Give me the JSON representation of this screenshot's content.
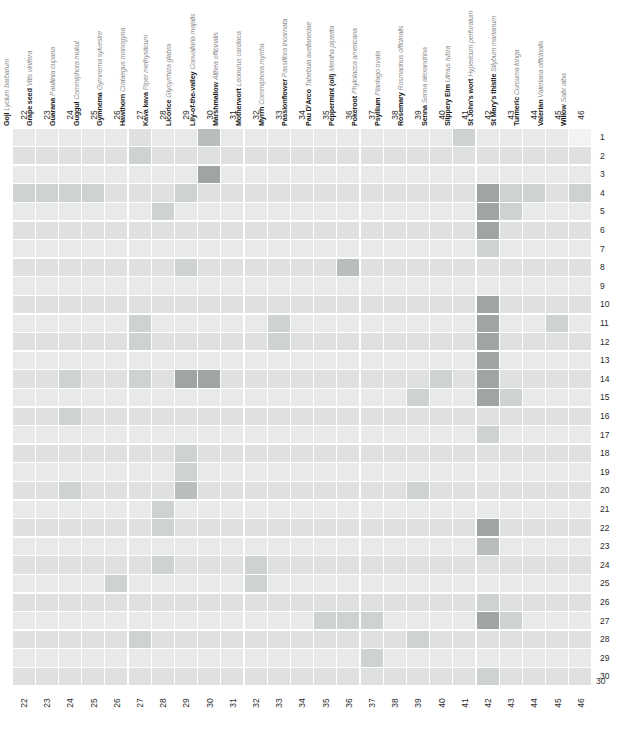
{
  "figure": {
    "type": "heatmap-matrix"
  },
  "columns": [
    {
      "index": "22",
      "common": "Goji",
      "latin": "Lycium barbarum"
    },
    {
      "index": "23",
      "common": "Grape seed",
      "latin": "Vitis vinifera"
    },
    {
      "index": "24",
      "common": "Guarana",
      "latin": "Paullinia cupana"
    },
    {
      "index": "25",
      "common": "Guggul",
      "latin": "Commiphora mukul"
    },
    {
      "index": "26",
      "common": "Gymnema",
      "latin": "Gymnema sylvestre"
    },
    {
      "index": "27",
      "common": "Hawthorn",
      "latin": "Crataegus monogyna"
    },
    {
      "index": "28",
      "common": "Kava kava",
      "latin": "Piper methysticum"
    },
    {
      "index": "29",
      "common": "Licorice",
      "latin": "Glycyrrhiza glabra"
    },
    {
      "index": "30",
      "common": "Lily-of-the-valley",
      "latin": "Convallaria majalis"
    },
    {
      "index": "31",
      "common": "Marshmallow",
      "latin": "Althea officinalis"
    },
    {
      "index": "32",
      "common": "Motherwort",
      "latin": "Leonurus cardiaca"
    },
    {
      "index": "33",
      "common": "Myrrh",
      "latin": "Commiphora myrrha"
    },
    {
      "index": "34",
      "common": "Passionflower",
      "latin": "Passiflora incarnata"
    },
    {
      "index": "35",
      "common": "Pau D'Arco",
      "latin": "Tabebuia avellanedae"
    },
    {
      "index": "36",
      "common": "Peppermint (oil)",
      "latin": "Mentha piperita"
    },
    {
      "index": "37",
      "common": "Pokeroot",
      "latin": "Phytolacca americana"
    },
    {
      "index": "38",
      "common": "Psyllium",
      "latin": "Plantago ovata"
    },
    {
      "index": "39",
      "common": "Rosemary",
      "latin": "Rosmarinus officinalis"
    },
    {
      "index": "40",
      "common": "Senna",
      "latin": "Senna alexandrina"
    },
    {
      "index": "41",
      "common": "Slippery Elm",
      "latin": "Ulmus rubra"
    },
    {
      "index": "42",
      "common": "St John's wort",
      "latin": "Hypericum perforatum"
    },
    {
      "index": "43",
      "common": "St Mary's thistle",
      "latin": "Silybum marianum"
    },
    {
      "index": "44",
      "common": "Turmeric",
      "latin": "Curcuma longa"
    },
    {
      "index": "45",
      "common": "Valerian",
      "latin": "Valeriana officinalis"
    },
    {
      "index": "46",
      "common": "Willow",
      "latin": "Salix alba"
    }
  ],
  "row_numbers": [
    "1",
    "2",
    "3",
    "4",
    "5",
    "6",
    "7",
    "8",
    "9",
    "10",
    "11",
    "12",
    "13",
    "14",
    "15",
    "16",
    "17",
    "18",
    "19",
    "20",
    "21",
    "22",
    "23",
    "24",
    "25",
    "26",
    "27",
    "28",
    "29",
    "30"
  ],
  "bottom_axis_numbers": [
    "22",
    "23",
    "24",
    "25",
    "26",
    "27",
    "28",
    "29",
    "30",
    "31",
    "32",
    "33",
    "34",
    "35",
    "36",
    "37",
    "38",
    "39",
    "40",
    "41",
    "42",
    "43",
    "44",
    "45",
    "46"
  ],
  "palette": {
    "level0": "#f2f3f3",
    "level1": "#e8eaea",
    "level2": "#dfe1e1",
    "level3": "#cfd2d2",
    "level4": "#b9bdbd",
    "level5": "#9fa4a4",
    "level6": "#7d8282",
    "gridline": "#ffffff"
  },
  "chart_data": {
    "type": "heatmap",
    "title": "",
    "xlabel": "",
    "ylabel": "",
    "x_categories": [
      "22",
      "23",
      "24",
      "25",
      "26",
      "27",
      "28",
      "29",
      "30",
      "31",
      "32",
      "33",
      "34",
      "35",
      "36",
      "37",
      "38",
      "39",
      "40",
      "41",
      "42",
      "43",
      "44",
      "45",
      "46"
    ],
    "y_categories": [
      "1",
      "2",
      "3",
      "4",
      "5",
      "6",
      "7",
      "8",
      "9",
      "10",
      "11",
      "12",
      "13",
      "14",
      "15",
      "16",
      "17",
      "18",
      "19",
      "20",
      "21",
      "22",
      "23",
      "24",
      "25",
      "26",
      "27",
      "28",
      "29",
      "30"
    ],
    "scale": "0 = lightest (no interaction) to 6 = darkest (strongest interaction)",
    "values": [
      [
        1,
        1,
        1,
        1,
        1,
        2,
        1,
        1,
        4,
        1,
        1,
        1,
        1,
        1,
        1,
        1,
        1,
        1,
        1,
        3,
        1,
        1,
        1,
        1,
        0
      ],
      [
        2,
        2,
        2,
        2,
        2,
        3,
        2,
        2,
        2,
        2,
        2,
        2,
        2,
        2,
        2,
        2,
        2,
        2,
        2,
        2,
        2,
        2,
        2,
        2,
        2
      ],
      [
        1,
        1,
        1,
        1,
        1,
        1,
        1,
        1,
        5,
        1,
        1,
        1,
        1,
        1,
        1,
        1,
        1,
        1,
        1,
        1,
        1,
        1,
        1,
        1,
        1
      ],
      [
        3,
        3,
        3,
        3,
        2,
        2,
        2,
        3,
        2,
        2,
        2,
        2,
        2,
        2,
        2,
        2,
        2,
        2,
        2,
        2,
        5,
        3,
        3,
        2,
        3
      ],
      [
        1,
        1,
        1,
        1,
        1,
        1,
        3,
        1,
        1,
        1,
        1,
        1,
        1,
        1,
        1,
        1,
        1,
        1,
        1,
        1,
        5,
        3,
        1,
        1,
        1
      ],
      [
        2,
        2,
        2,
        2,
        2,
        2,
        2,
        2,
        2,
        2,
        2,
        2,
        2,
        2,
        2,
        2,
        2,
        2,
        2,
        2,
        5,
        2,
        2,
        2,
        2
      ],
      [
        1,
        1,
        1,
        1,
        1,
        1,
        1,
        1,
        1,
        1,
        1,
        1,
        1,
        1,
        1,
        1,
        1,
        1,
        1,
        1,
        3,
        1,
        1,
        1,
        1
      ],
      [
        2,
        2,
        2,
        2,
        2,
        2,
        2,
        3,
        2,
        2,
        2,
        2,
        2,
        2,
        4,
        2,
        2,
        2,
        2,
        2,
        2,
        2,
        2,
        2,
        2
      ],
      [
        1,
        1,
        1,
        1,
        1,
        1,
        1,
        1,
        1,
        1,
        1,
        1,
        1,
        1,
        1,
        1,
        1,
        1,
        1,
        1,
        1,
        1,
        1,
        1,
        1
      ],
      [
        2,
        2,
        2,
        2,
        2,
        2,
        2,
        2,
        2,
        2,
        2,
        2,
        2,
        2,
        2,
        2,
        2,
        2,
        2,
        2,
        5,
        2,
        2,
        2,
        2
      ],
      [
        1,
        1,
        1,
        1,
        1,
        3,
        1,
        1,
        1,
        1,
        1,
        3,
        1,
        1,
        1,
        1,
        1,
        1,
        1,
        1,
        5,
        1,
        1,
        3,
        1
      ],
      [
        2,
        2,
        2,
        2,
        2,
        3,
        2,
        2,
        2,
        2,
        2,
        3,
        2,
        2,
        2,
        2,
        2,
        2,
        2,
        2,
        5,
        2,
        2,
        2,
        2
      ],
      [
        1,
        1,
        1,
        1,
        1,
        1,
        1,
        1,
        1,
        1,
        1,
        1,
        1,
        1,
        1,
        1,
        1,
        1,
        1,
        1,
        5,
        1,
        1,
        1,
        1
      ],
      [
        2,
        2,
        3,
        2,
        2,
        3,
        2,
        5,
        5,
        2,
        2,
        2,
        2,
        2,
        2,
        2,
        2,
        2,
        3,
        2,
        5,
        2,
        2,
        2,
        2
      ],
      [
        1,
        1,
        1,
        1,
        1,
        1,
        1,
        1,
        1,
        1,
        1,
        1,
        1,
        1,
        1,
        1,
        1,
        3,
        1,
        1,
        5,
        3,
        1,
        1,
        1
      ],
      [
        2,
        2,
        3,
        2,
        2,
        2,
        2,
        2,
        2,
        2,
        2,
        2,
        2,
        2,
        2,
        2,
        2,
        2,
        2,
        2,
        2,
        2,
        2,
        2,
        2
      ],
      [
        1,
        1,
        1,
        1,
        1,
        1,
        1,
        1,
        1,
        1,
        1,
        1,
        1,
        1,
        1,
        1,
        1,
        1,
        1,
        1,
        3,
        1,
        1,
        1,
        1
      ],
      [
        2,
        2,
        2,
        2,
        2,
        2,
        2,
        3,
        2,
        2,
        2,
        2,
        2,
        2,
        2,
        2,
        2,
        2,
        2,
        2,
        2,
        2,
        2,
        2,
        2
      ],
      [
        1,
        1,
        1,
        1,
        1,
        1,
        1,
        3,
        1,
        1,
        1,
        1,
        1,
        1,
        1,
        1,
        1,
        1,
        1,
        1,
        1,
        1,
        1,
        1,
        1
      ],
      [
        2,
        2,
        3,
        2,
        2,
        2,
        2,
        4,
        2,
        2,
        2,
        2,
        2,
        2,
        2,
        2,
        2,
        3,
        2,
        2,
        2,
        2,
        2,
        2,
        2
      ],
      [
        1,
        1,
        1,
        1,
        1,
        1,
        3,
        1,
        1,
        1,
        1,
        1,
        1,
        1,
        1,
        1,
        1,
        1,
        1,
        1,
        1,
        1,
        1,
        1,
        1
      ],
      [
        2,
        2,
        2,
        2,
        2,
        2,
        3,
        2,
        2,
        2,
        2,
        2,
        2,
        2,
        2,
        2,
        2,
        2,
        2,
        2,
        5,
        2,
        2,
        2,
        2
      ],
      [
        1,
        1,
        1,
        1,
        1,
        1,
        1,
        1,
        1,
        1,
        1,
        1,
        1,
        1,
        1,
        1,
        1,
        1,
        1,
        1,
        4,
        1,
        1,
        1,
        1
      ],
      [
        2,
        2,
        2,
        2,
        2,
        2,
        3,
        2,
        2,
        2,
        3,
        2,
        2,
        2,
        2,
        2,
        2,
        2,
        2,
        2,
        2,
        2,
        2,
        2,
        2
      ],
      [
        1,
        1,
        1,
        1,
        3,
        1,
        1,
        1,
        1,
        1,
        3,
        1,
        1,
        1,
        1,
        1,
        1,
        1,
        1,
        1,
        1,
        1,
        1,
        1,
        1
      ],
      [
        2,
        2,
        2,
        2,
        2,
        2,
        2,
        2,
        2,
        2,
        2,
        2,
        2,
        2,
        2,
        2,
        2,
        2,
        2,
        2,
        3,
        2,
        2,
        2,
        2
      ],
      [
        1,
        1,
        1,
        1,
        1,
        1,
        1,
        1,
        1,
        1,
        1,
        1,
        1,
        3,
        3,
        3,
        1,
        1,
        1,
        1,
        5,
        3,
        1,
        1,
        1
      ],
      [
        2,
        2,
        2,
        2,
        2,
        3,
        2,
        2,
        2,
        2,
        2,
        2,
        2,
        2,
        2,
        2,
        2,
        3,
        2,
        2,
        2,
        2,
        2,
        2,
        2
      ],
      [
        1,
        1,
        1,
        1,
        1,
        1,
        1,
        1,
        1,
        1,
        1,
        1,
        1,
        1,
        1,
        3,
        1,
        1,
        1,
        1,
        1,
        1,
        1,
        1,
        1
      ],
      [
        2,
        2,
        2,
        2,
        2,
        2,
        2,
        2,
        2,
        2,
        2,
        2,
        2,
        2,
        2,
        2,
        2,
        2,
        2,
        2,
        3,
        2,
        2,
        2,
        2
      ]
    ]
  }
}
